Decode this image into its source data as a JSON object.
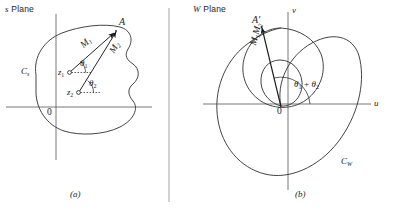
{
  "figure": {
    "panels": [
      {
        "key": "a",
        "caption": "(a)",
        "plane_title_prefix": "s",
        "plane_title_suffix": " Plane",
        "curve_label": "C",
        "curve_label_sub": "s",
        "origin": "0",
        "point_label": "A",
        "vectors": [
          {
            "label": "M",
            "sub": "1"
          },
          {
            "label": "M",
            "sub": "2"
          }
        ],
        "zeros": [
          {
            "label": "z",
            "sub": "1"
          },
          {
            "label": "z",
            "sub": "2"
          }
        ],
        "angles": [
          {
            "label": "θ",
            "sub": "1"
          },
          {
            "label": "θ",
            "sub": "2"
          }
        ]
      },
      {
        "key": "b",
        "caption": "(b)",
        "plane_title_prefix": "W",
        "plane_title_suffix": " Plane",
        "curve_label": "C",
        "curve_label_sub": "W",
        "origin": "0",
        "point_label": "A′",
        "axis_x": "u",
        "axis_y": "v",
        "vector_label_main": "M",
        "vector_label_sub1": "1",
        "vector_label_main2": "M",
        "vector_label_sub2": "2",
        "angle_sum_theta": "θ",
        "angle_sum_sub1": "1",
        "angle_sum_plus": "+",
        "angle_sum_sub2": "2"
      }
    ],
    "colors": {
      "ink": "#1c1c1c",
      "curve": "#3a3a3a",
      "axis": "#555555",
      "divider": "#9a9a9a"
    }
  }
}
